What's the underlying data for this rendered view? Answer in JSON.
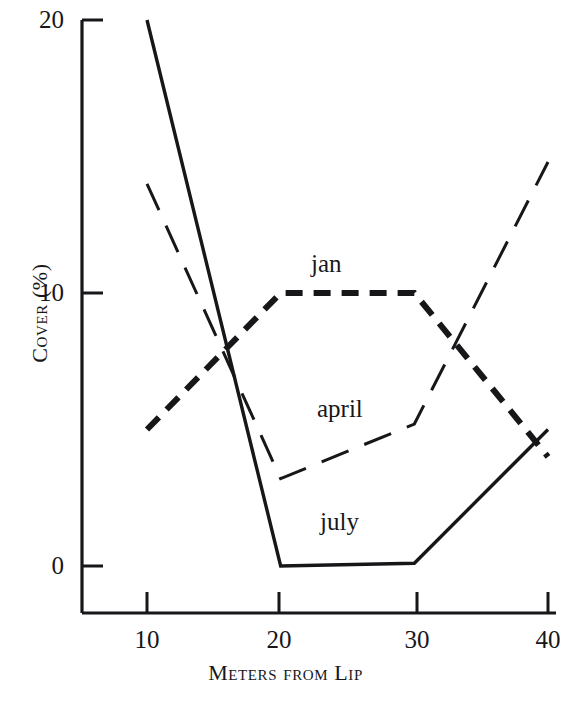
{
  "chart_data": {
    "type": "line",
    "title": "",
    "xlabel": "Meters from Lip",
    "ylabel": "Cover (%)",
    "xlim": [
      7,
      40
    ],
    "ylim": [
      -2,
      20
    ],
    "xticks": [
      10,
      20,
      30,
      40
    ],
    "yticks": [
      0,
      10,
      20
    ],
    "xtick_labels": [
      "10",
      "20",
      "30",
      "40"
    ],
    "ytick_labels": [
      "0",
      "10",
      "20"
    ],
    "grid": false,
    "legend_position": "inline-annotations",
    "series": [
      {
        "name": "jan",
        "style": "short-dash",
        "label": "jan",
        "x": [
          10,
          20,
          30,
          40
        ],
        "values": [
          5.0,
          10.0,
          10.0,
          4.0
        ]
      },
      {
        "name": "april",
        "style": "long-dash",
        "label": "april",
        "x": [
          10,
          20,
          30,
          40
        ],
        "values": [
          14.0,
          3.2,
          5.2,
          14.8
        ]
      },
      {
        "name": "july",
        "style": "solid",
        "label": "july",
        "x": [
          10,
          20,
          30,
          40
        ],
        "values": [
          20.0,
          0.0,
          0.1,
          5.0
        ]
      }
    ],
    "annotations": [
      {
        "text": "jan",
        "x": 21.5,
        "y": 12.2
      },
      {
        "text": "april",
        "x": 24.5,
        "y": 4.8
      },
      {
        "text": "july",
        "x": 24.0,
        "y": 1.4
      }
    ]
  }
}
